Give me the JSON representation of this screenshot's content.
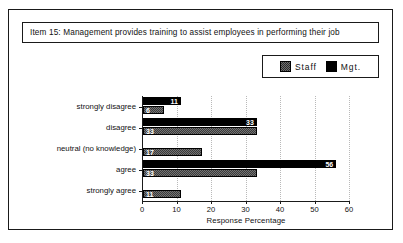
{
  "title": {
    "item": "Item 15:",
    "text": "Item 15:   Management provides training to assist employees in performing their job"
  },
  "legend": {
    "position": "top-right",
    "entries": [
      {
        "label": "Staff",
        "swatch": "dither-gray-swatch",
        "color": "#737373"
      },
      {
        "label": "Mgt.",
        "swatch": "solid-black-swatch",
        "color": "#000000"
      }
    ]
  },
  "chart_data": {
    "type": "bar",
    "orientation": "horizontal",
    "title": "Item 15:   Management provides training to assist employees in performing their job",
    "xlabel": "Response Percentage",
    "ylabel": "",
    "xlim": [
      0,
      60
    ],
    "xticks": [
      0,
      10,
      20,
      30,
      40,
      50,
      60
    ],
    "xtick_labels": [
      "0",
      "10",
      "20",
      "30",
      "40",
      "50",
      "60"
    ],
    "grid": "vertical-dotted",
    "legend_position": "top-right",
    "categories": [
      "strongly disagree",
      "disagree",
      "neutral (no knowledge)",
      "agree",
      "strongly agree"
    ],
    "series": [
      {
        "name": "Mgt.",
        "values": [
          11,
          33,
          null,
          56,
          null
        ]
      },
      {
        "name": "Staff",
        "values": [
          6,
          33,
          17,
          33,
          11
        ]
      }
    ]
  },
  "axis": {
    "x_title": "Response Percentage"
  }
}
